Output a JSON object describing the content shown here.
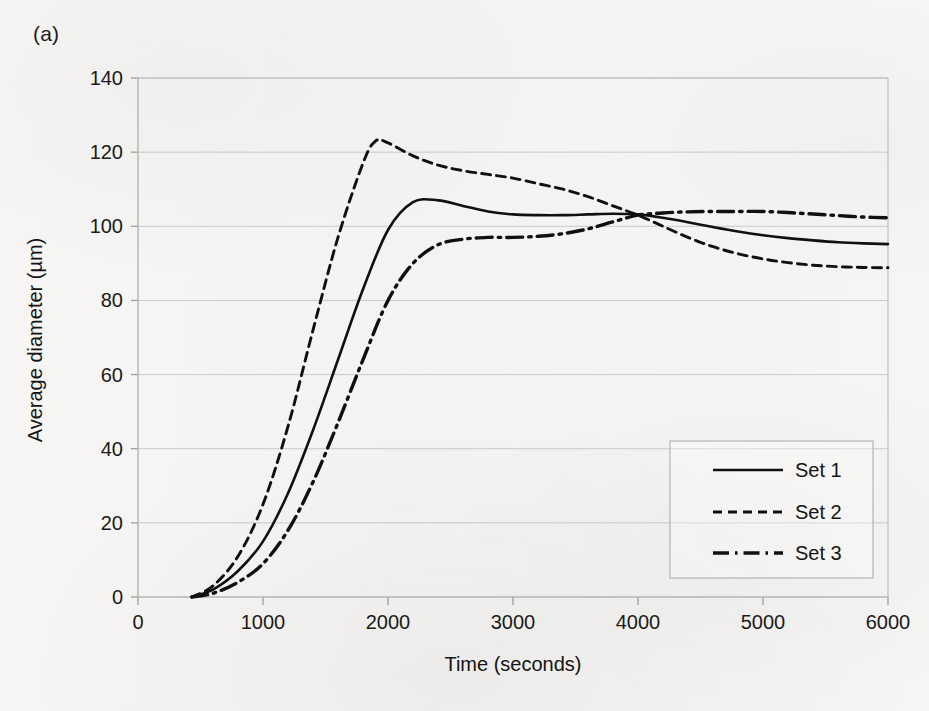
{
  "figure": {
    "panel_label": "(a)",
    "background_color": "#f6f5f3",
    "ink_color": "#101010",
    "gridline_color": "#c9c9c9"
  },
  "chart_data": {
    "type": "line",
    "title": "",
    "subtitle": "",
    "xlabel": "Time (seconds)",
    "ylabel": "Average diameter (µm)",
    "xlim": [
      0,
      6000
    ],
    "ylim": [
      0,
      140
    ],
    "xticks": [
      0,
      1000,
      2000,
      3000,
      4000,
      5000,
      6000
    ],
    "yticks": [
      0,
      20,
      40,
      60,
      80,
      100,
      120,
      140
    ],
    "xtick_labels": [
      "0",
      "1000",
      "2000",
      "3000",
      "4000",
      "5000",
      "6000"
    ],
    "ytick_labels": [
      "0",
      "20",
      "40",
      "60",
      "80",
      "100",
      "120",
      "140"
    ],
    "grid": "horizontal",
    "legend_position": "lower right",
    "series": [
      {
        "name": "Set 1",
        "style": "solid",
        "x": [
          430,
          600,
          800,
          1000,
          1200,
          1400,
          1600,
          1800,
          2000,
          2200,
          2400,
          2600,
          2800,
          3000,
          3200,
          3400,
          3600,
          3800,
          4000,
          4200,
          4400,
          4600,
          4800,
          5000,
          5200,
          5400,
          5600,
          5800,
          6000
        ],
        "y": [
          0,
          2,
          7,
          15,
          28,
          45,
          64,
          83,
          99,
          106.5,
          107,
          105.5,
          104,
          103.2,
          103,
          103,
          103.2,
          103.4,
          103.2,
          102.3,
          101.1,
          99.8,
          98.6,
          97.6,
          96.8,
          96.2,
          95.7,
          95.4,
          95.2
        ]
      },
      {
        "name": "Set 2",
        "style": "dashed",
        "x": [
          430,
          600,
          800,
          1000,
          1200,
          1400,
          1600,
          1800,
          1900,
          2000,
          2200,
          2400,
          2600,
          2800,
          3000,
          3200,
          3400,
          3600,
          3800,
          4000,
          4200,
          4400,
          4600,
          4800,
          5000,
          5200,
          5400,
          5600,
          5800,
          6000
        ],
        "y": [
          0,
          3,
          11,
          25,
          46,
          72,
          97,
          117,
          123,
          122.5,
          119,
          116.5,
          115,
          114,
          113,
          111.5,
          110,
          108,
          105.5,
          103,
          100,
          97,
          94.5,
          92.6,
          91.2,
          90.2,
          89.5,
          89.1,
          88.9,
          88.8
        ]
      },
      {
        "name": "Set 3",
        "style": "dashdot",
        "x": [
          430,
          600,
          800,
          1000,
          1200,
          1400,
          1600,
          1800,
          2000,
          2200,
          2400,
          2600,
          2800,
          3000,
          3200,
          3400,
          3600,
          3800,
          4000,
          4200,
          4400,
          4600,
          4800,
          5000,
          5200,
          5400,
          5600,
          5800,
          6000
        ],
        "y": [
          0,
          1,
          4,
          9,
          18,
          31,
          47,
          64,
          80,
          90,
          95,
          96.5,
          97,
          97,
          97.3,
          98,
          99.3,
          101.2,
          103,
          103.6,
          103.9,
          104,
          104,
          104,
          103.7,
          103.3,
          102.9,
          102.5,
          102.3
        ]
      }
    ],
    "annotations": [
      "All three series start from zero near 430 seconds.",
      "All three curves intersect near 4000 seconds at about 103 micrometres."
    ]
  },
  "legend": {
    "entries": [
      {
        "label": "Set 1",
        "style": "solid"
      },
      {
        "label": "Set 2",
        "style": "dashed"
      },
      {
        "label": "Set 3",
        "style": "dashdot"
      }
    ]
  }
}
